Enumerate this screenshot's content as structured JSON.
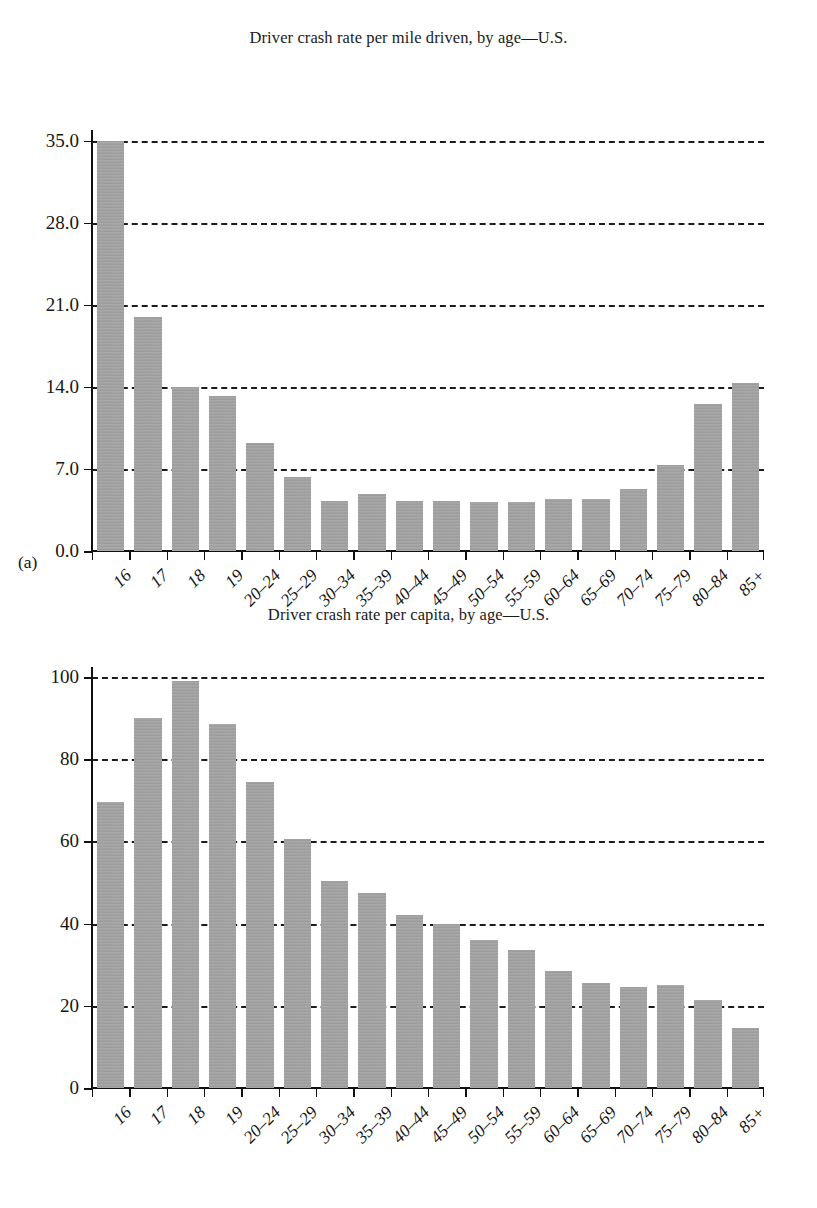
{
  "figure": {
    "panel_a_label": "(a)",
    "panel_b_label": "(b)",
    "bar_color": "#a3a3a3",
    "grid_color": "#1c1c1c",
    "axis_color": "#111111"
  },
  "chart_data": [
    {
      "type": "bar",
      "panel": "(a)",
      "title": "Driver crash rate per mile driven, by age—U.S.",
      "xlabel": "",
      "ylabel": "",
      "categories": [
        "16",
        "17",
        "18",
        "19",
        "20–24",
        "25–29",
        "30–34",
        "35–39",
        "40–44",
        "45–49",
        "50–54",
        "55–59",
        "60–64",
        "65–69",
        "70–74",
        "75–79",
        "80–84",
        "85+"
      ],
      "values": [
        35.0,
        20.0,
        14.0,
        13.2,
        9.2,
        6.3,
        4.3,
        4.9,
        4.3,
        4.3,
        4.2,
        4.2,
        4.4,
        4.4,
        5.3,
        7.3,
        12.5,
        14.3
      ],
      "ytick_labels": [
        "0.0",
        "7.0",
        "14.0",
        "21.0",
        "28.0",
        "35.0"
      ],
      "ytick_values": [
        0.0,
        7.0,
        14.0,
        21.0,
        28.0,
        35.0
      ],
      "ylim": [
        0.0,
        35.4
      ],
      "grid": true,
      "grid_style": "dashed-horizontal",
      "legend": null
    },
    {
      "type": "bar",
      "panel": "(b)",
      "title": "Driver crash rate per capita, by age—U.S.",
      "xlabel": "",
      "ylabel": "",
      "categories": [
        "16",
        "17",
        "18",
        "19",
        "20–24",
        "25–29",
        "30–34",
        "35–39",
        "40–44",
        "45–49",
        "50–54",
        "55–59",
        "60–64",
        "65–69",
        "70–74",
        "75–79",
        "80–84",
        "85+"
      ],
      "values": [
        69.5,
        90.0,
        99.0,
        88.5,
        74.5,
        60.5,
        50.5,
        47.5,
        42.0,
        40.0,
        36.0,
        33.5,
        28.5,
        25.5,
        24.5,
        25.0,
        21.5,
        14.5
      ],
      "ytick_labels": [
        "0",
        "20",
        "40",
        "60",
        "80",
        "100"
      ],
      "ytick_values": [
        0,
        20,
        40,
        60,
        80,
        100
      ],
      "ylim": [
        0,
        101
      ],
      "grid": true,
      "grid_style": "dashed-horizontal",
      "legend": null
    }
  ]
}
